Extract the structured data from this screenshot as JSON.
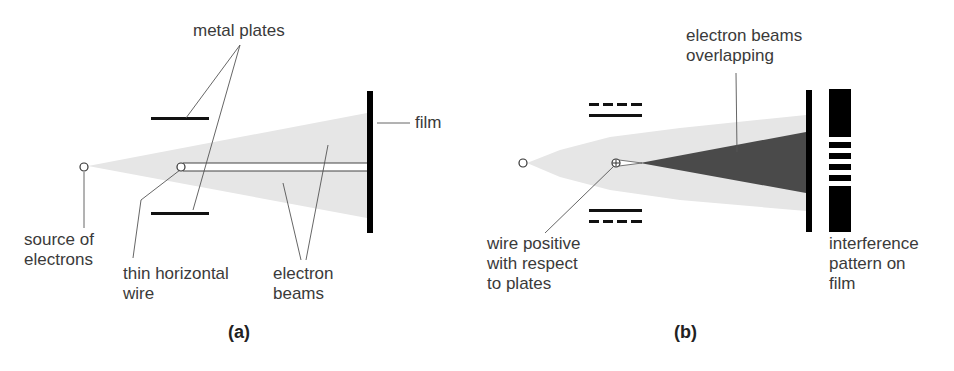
{
  "panel_a": {
    "caption": "(a)",
    "labels": {
      "metal_plates": "metal plates",
      "film": "film",
      "source": "source of\nelectrons",
      "wire": "thin horizontal\nwire",
      "beams": "electron\nbeams"
    }
  },
  "panel_b": {
    "caption": "(b)",
    "labels": {
      "overlap": "electron beams\noverlapping",
      "wire_positive": "wire positive\nwith respect\nto plates",
      "pattern": "interference\npattern on\nfilm"
    }
  },
  "colors": {
    "beam": "#e6e6e6",
    "overlap": "#4a4a4a",
    "ink": "#000000",
    "text": "#3a3a3a"
  }
}
